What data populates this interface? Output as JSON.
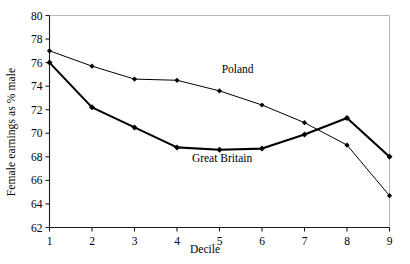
{
  "chart_data": {
    "type": "line",
    "title": "",
    "xlabel": "Decile",
    "ylabel": "Female earnings as % male",
    "categories": [
      1,
      2,
      3,
      4,
      5,
      6,
      7,
      8,
      9
    ],
    "x": [
      1,
      2,
      3,
      4,
      5,
      6,
      7,
      8,
      9
    ],
    "xlim": [
      1,
      9
    ],
    "ylim": [
      62,
      80
    ],
    "yticks": [
      62,
      64,
      66,
      68,
      70,
      72,
      74,
      76,
      78,
      80
    ],
    "xticks": [
      1,
      2,
      3,
      4,
      5,
      6,
      7,
      8,
      9
    ],
    "grid": false,
    "legend_position": "inline-annotation",
    "series": [
      {
        "name": "Poland",
        "values": [
          77.0,
          75.7,
          74.6,
          74.5,
          73.6,
          72.4,
          70.9,
          69.0,
          64.7
        ],
        "color": "#000000",
        "line_width": 1,
        "marker": "diamond",
        "label_x": 5.05,
        "label_y": 75.1
      },
      {
        "name": "Great Britain",
        "values": [
          76.0,
          72.2,
          70.5,
          68.8,
          68.6,
          68.7,
          69.9,
          71.3,
          68.0
        ],
        "color": "#000000",
        "line_width": 2.1,
        "marker": "diamond",
        "label_x": 4.35,
        "label_y": 67.6
      }
    ],
    "annotations": [
      {
        "text": "Poland",
        "x": 5.05,
        "y": 75.1
      },
      {
        "text": "Great Britain",
        "x": 4.35,
        "y": 67.6
      }
    ]
  },
  "axis": {
    "y_tick_labels": [
      "80",
      "78",
      "76",
      "74",
      "72",
      "70",
      "68",
      "66",
      "64",
      "62"
    ],
    "x_tick_labels": [
      "1",
      "2",
      "3",
      "4",
      "5",
      "6",
      "7",
      "8",
      "9"
    ],
    "ylabel": "Female earnings as % male",
    "xlabel": "Decile"
  },
  "style": {
    "axis_color": "#1a1a1a",
    "frame_color": "#b8b8b8",
    "series_color": "#000000",
    "background": "#ffffff"
  }
}
